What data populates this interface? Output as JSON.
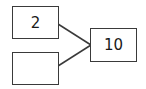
{
  "diagram": {
    "type": "number-bond",
    "parts": [
      {
        "id": "part-top",
        "value": "2"
      },
      {
        "id": "part-bottom",
        "value": ""
      }
    ],
    "whole": {
      "id": "whole",
      "value": "10"
    },
    "colors": {
      "stroke": "#3a3a3a",
      "text": "#1a1a1a",
      "background": "#ffffff"
    }
  }
}
